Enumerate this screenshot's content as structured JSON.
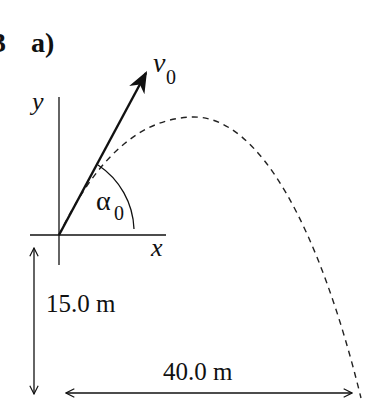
{
  "figure": {
    "problem_number": "3",
    "part_label": "a)",
    "axes": {
      "x_label": "x",
      "y_label": "y"
    },
    "velocity": {
      "symbol": "v",
      "subscript": "0"
    },
    "angle": {
      "symbol": "α",
      "subscript": "0"
    },
    "dimensions": {
      "height": "15.0 m",
      "horizontal_distance": "40.0 m"
    },
    "colors": {
      "ink": "#111111",
      "background": "#ffffff"
    }
  }
}
